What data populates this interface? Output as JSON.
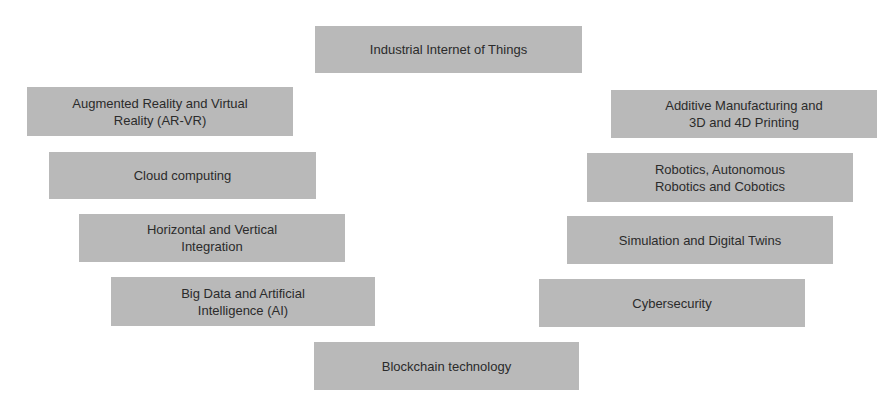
{
  "diagram": {
    "colors": {
      "box_fill": "#b9b9b9",
      "text": "#2b2b2b",
      "background": "#ffffff"
    },
    "center_top": "Industrial Internet of Things",
    "center_bottom": "Blockchain technology",
    "left": [
      "Augmented Reality and Virtual\nReality (AR-VR)",
      "Cloud computing",
      "Horizontal and Vertical\nIntegration",
      "Big Data and Artificial\nIntelligence (AI)"
    ],
    "right": [
      "Additive Manufacturing and\n3D and 4D Printing",
      "Robotics, Autonomous\nRobotics and Cobotics",
      "Simulation and Digital Twins",
      "Cybersecurity"
    ]
  }
}
